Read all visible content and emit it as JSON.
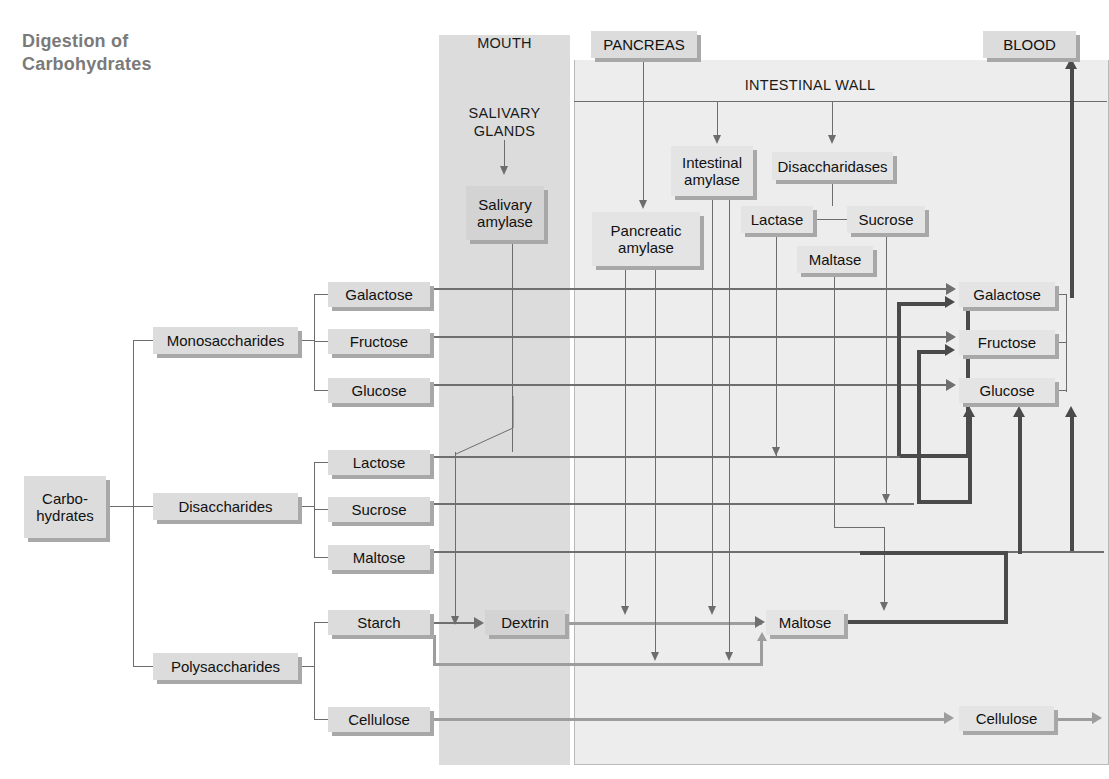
{
  "title": "Digestion of\nCarbohydrates",
  "regions": {
    "mouth": "MOUTH",
    "salivary_glands": "SALIVARY\nGLANDS",
    "intestinal_wall": "INTESTINAL WALL"
  },
  "organs": {
    "pancreas": "PANCREAS",
    "blood": "BLOOD"
  },
  "enzymes": {
    "salivary_amylase": "Salivary\namylase",
    "pancreatic_amylase": "Pancreatic\namylase",
    "intestinal_amylase": "Intestinal\namylase",
    "disaccharidases": "Disaccharidases",
    "lactase": "Lactase",
    "sucrose": "Sucrose",
    "maltase": "Maltase"
  },
  "hierarchy": {
    "root": "Carbo-\nhydrates",
    "groups": [
      {
        "name": "Monosaccharides",
        "members": [
          "Galactose",
          "Fructose",
          "Glucose"
        ]
      },
      {
        "name": "Disaccharides",
        "members": [
          "Lactose",
          "Sucrose",
          "Maltose"
        ]
      },
      {
        "name": "Polysaccharides",
        "members": [
          "Starch",
          "Cellulose"
        ]
      }
    ]
  },
  "intermediates": {
    "dextrin": "Dextrin",
    "maltose": "Maltose"
  },
  "products": {
    "galactose": "Galactose",
    "fructose": "Fructose",
    "glucose": "Glucose",
    "cellulose": "Cellulose"
  },
  "colors": {
    "title": "#7a7a7a",
    "mouth_panel": "#dcdcdc",
    "intestine_panel": "#ededed",
    "box_fill": "#dcdcdc",
    "box_shadow": "#a8a8a8",
    "line": "#6f6f6f",
    "line_dark": "#4a4a4a",
    "line_pale": "#9d9d9d"
  }
}
